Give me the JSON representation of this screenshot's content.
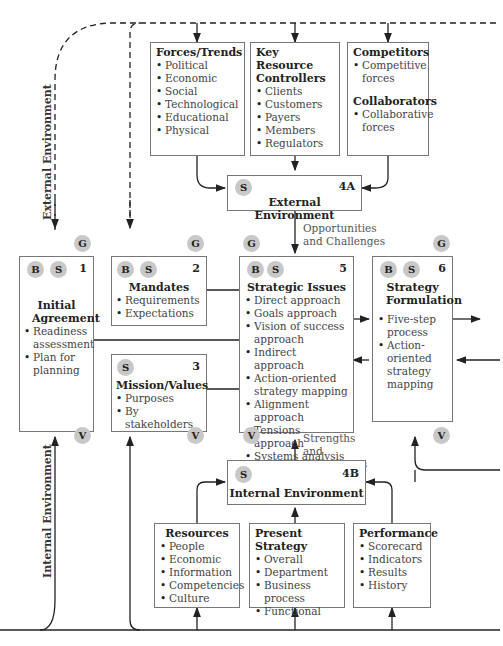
{
  "side_labels": {
    "external": "External Environment",
    "internal": "Internal Environment"
  },
  "external_boxes": [
    {
      "title": "Forces/Trends",
      "items": [
        "Political",
        "Economic",
        "Social",
        "Technological",
        "Educational",
        "Physical"
      ]
    },
    {
      "title": "Key Resource Controllers",
      "items": [
        "Clients",
        "Customers",
        "Payers",
        "Members",
        "Regulators"
      ]
    },
    {
      "title": "Competitors",
      "items": [
        "Competitive forces"
      ],
      "title2": "Collaborators",
      "items2": [
        "Collaborative forces"
      ]
    }
  ],
  "box_4a": {
    "badge": "S",
    "number": "4A",
    "title": "External Environment"
  },
  "flow_labels": {
    "opportunities": "Opportunities and Challenges",
    "strengths": "Strengths and Weaknesses"
  },
  "box_1": {
    "badges": [
      "B",
      "S"
    ],
    "number": "1",
    "title": "Initial Agreement",
    "items": [
      "Readiness assessment",
      "Plan for planning"
    ]
  },
  "box_2": {
    "badges": [
      "B",
      "S"
    ],
    "number": "2",
    "title": "Mandates",
    "items": [
      "Requirements",
      "Expectations"
    ]
  },
  "box_3": {
    "badges": [
      "S"
    ],
    "number": "3",
    "title": "Mission/Values",
    "items": [
      "Purposes",
      "By stakeholders"
    ]
  },
  "box_5": {
    "badges": [
      "B",
      "S"
    ],
    "number": "5",
    "title": "Strategic Issues",
    "items": [
      "Direct approach",
      "Goals approach",
      "Vision of success approach",
      "Indirect approach",
      "Action-oriented strategy mapping",
      "Alignment approach",
      "Tensions approach",
      "Systems analysis"
    ]
  },
  "box_6": {
    "badges": [
      "B",
      "S"
    ],
    "number": "6",
    "title": "Strategy Formulation",
    "items": [
      "Five-step process",
      "Action-oriented strategy mapping"
    ]
  },
  "box_4b": {
    "badge": "S",
    "number": "4B",
    "title": "Internal Environment"
  },
  "internal_boxes": [
    {
      "title": "Resources",
      "items": [
        "People",
        "Economic",
        "Information",
        "Competencies",
        "Culture"
      ]
    },
    {
      "title": "Present Strategy",
      "items": [
        "Overall",
        "Department",
        "Business process",
        "Functional"
      ]
    },
    {
      "title": "Performance",
      "items": [
        "Scorecard",
        "Indicators",
        "Results",
        "History"
      ]
    }
  ],
  "markers": {
    "g": "G",
    "v": "V"
  }
}
